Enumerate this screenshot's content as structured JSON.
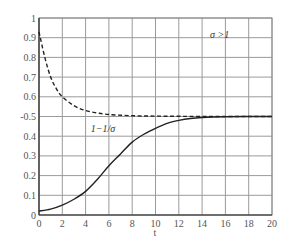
{
  "chart_data": {
    "type": "line",
    "title": "",
    "xlabel": "t",
    "ylabel": "",
    "xlim": [
      0,
      20
    ],
    "ylim": [
      0,
      1
    ],
    "grid": true,
    "legend": "none",
    "x_ticks": [
      "0",
      "2",
      "4",
      "6",
      "8",
      "10",
      "12",
      "14",
      "16",
      "18",
      "20"
    ],
    "y_ticks": [
      "0",
      "0.1",
      "0.2",
      "0.3",
      "0.4",
      "-0.5",
      "0.6",
      "0.7",
      "0.8",
      "0.9",
      "1"
    ],
    "series": [
      {
        "name": "σ>1",
        "style": "dashed",
        "x": [
          0,
          0.5,
          1,
          1.5,
          2,
          3,
          4,
          5,
          6,
          8,
          10,
          12,
          14,
          16,
          18,
          20
        ],
        "values": [
          0.93,
          0.8,
          0.7,
          0.64,
          0.6,
          0.555,
          0.53,
          0.518,
          0.51,
          0.504,
          0.502,
          0.501,
          0.5,
          0.5,
          0.5,
          0.5
        ]
      },
      {
        "name": "1−1/σ",
        "style": "solid",
        "x": [
          0,
          1,
          2,
          3,
          4,
          5,
          6,
          7,
          8,
          9,
          10,
          11,
          12,
          13,
          14,
          16,
          18,
          20
        ],
        "values": [
          0.02,
          0.03,
          0.05,
          0.08,
          0.12,
          0.18,
          0.25,
          0.31,
          0.37,
          0.41,
          0.44,
          0.465,
          0.48,
          0.49,
          0.495,
          0.499,
          0.5,
          0.5
        ]
      }
    ],
    "annotations": [
      {
        "text": "σ >1",
        "x": 15.5,
        "y": 0.9
      },
      {
        "text": "1−1/σ",
        "x": 5.5,
        "y": 0.42
      }
    ]
  }
}
